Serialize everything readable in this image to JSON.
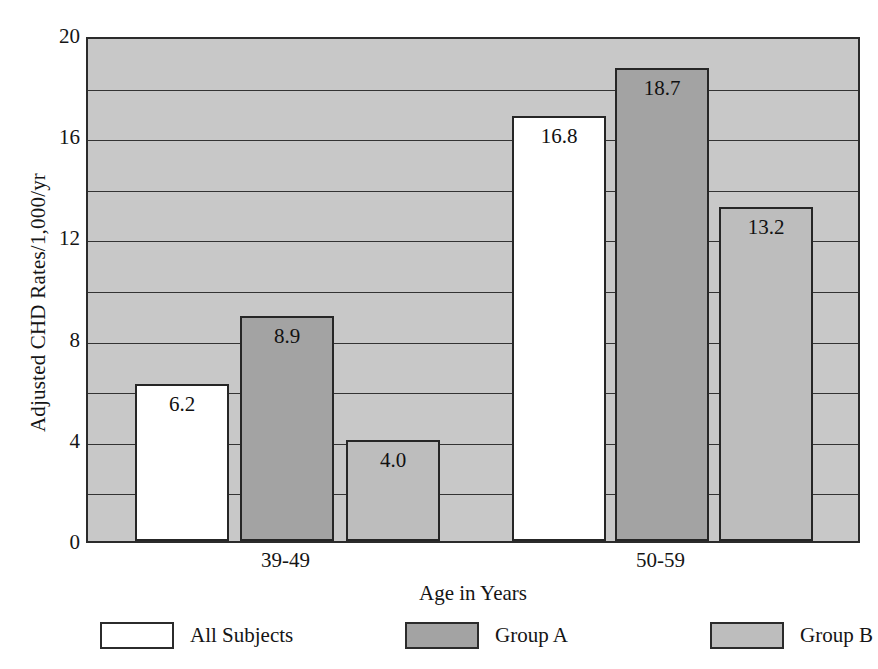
{
  "chart_data": {
    "type": "bar",
    "title": "",
    "xlabel": "Age in Years",
    "ylabel": "Adjusted CHD Rates/1,000/yr",
    "categories": [
      "39-49",
      "50-59"
    ],
    "series": [
      {
        "name": "All Subjects",
        "values": [
          6.2,
          16.8
        ],
        "color": "#ffffff"
      },
      {
        "name": "Group A",
        "values": [
          8.9,
          18.7
        ],
        "color": "#a3a3a3"
      },
      {
        "name": "Group B",
        "values": [
          4.0,
          13.2
        ],
        "color": "#bdbdbd"
      }
    ],
    "value_labels": [
      [
        "6.2",
        "16.8"
      ],
      [
        "8.9",
        "18.7"
      ],
      [
        "4.0",
        "13.2"
      ]
    ],
    "ylim": [
      0,
      20
    ],
    "ytick_labels": [
      "0",
      "4",
      "8",
      "12",
      "16",
      "20"
    ],
    "ytick_values": [
      0,
      4,
      8,
      12,
      16,
      20
    ],
    "gridline_values": [
      2,
      4,
      6,
      8,
      10,
      12,
      14,
      16,
      18
    ],
    "grid": true,
    "legend_position": "bottom",
    "plot_background": "#c8c8c8",
    "axis_color": "#2b2b2b"
  },
  "axes": {
    "y_title": "Adjusted CHD Rates/1,000/yr",
    "x_title": "Age in Years"
  },
  "legend": {
    "items": [
      {
        "label": "All Subjects"
      },
      {
        "label": "Group A"
      },
      {
        "label": "Group B"
      }
    ]
  }
}
